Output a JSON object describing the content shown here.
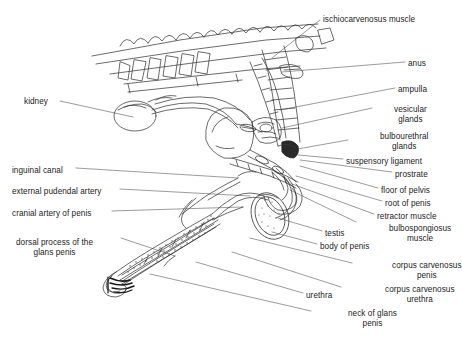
{
  "figure": {
    "background_color": "#ffffff",
    "line_color": "#3a3a3a",
    "text_color": "#1c1c1c",
    "style": "black-and-white line drawing with leader lines"
  },
  "labels_left": [
    {
      "id": "kidney",
      "text": "kidney",
      "x": 24,
      "y": 97,
      "align": "left",
      "lines": [
        "kidney"
      ]
    },
    {
      "id": "inguinal-canal",
      "text": "inguinal canal",
      "x": 12,
      "y": 166,
      "align": "left",
      "lines": [
        "inguinal canal"
      ]
    },
    {
      "id": "external-pudendal-artery",
      "text": "external pudendal artery",
      "x": 12,
      "y": 187,
      "align": "left",
      "lines": [
        "external pudendal artery"
      ]
    },
    {
      "id": "cranial-artery-of-penis",
      "text": "cranial artery of penis",
      "x": 12,
      "y": 209,
      "align": "left",
      "lines": [
        "cranial artery of penis"
      ]
    },
    {
      "id": "dorsal-process-glans",
      "text": "dorsal process of the glans penis",
      "x": 16,
      "y": 238,
      "align": "center",
      "lines": [
        "dorsal process of the",
        "glans penis"
      ]
    }
  ],
  "labels_right": [
    {
      "id": "ischiocarvenosus-muscle",
      "text": "ischiocarvenosus muscle",
      "x": 323,
      "y": 15,
      "align": "left",
      "lines": [
        "ischiocarvenosus muscle"
      ]
    },
    {
      "id": "anus",
      "text": "anus",
      "x": 408,
      "y": 59,
      "align": "left",
      "lines": [
        "anus"
      ]
    },
    {
      "id": "ampulla",
      "text": "ampulla",
      "x": 398,
      "y": 85,
      "align": "left",
      "lines": [
        "ampulla"
      ]
    },
    {
      "id": "vesicular-glands",
      "text": "vesicular glands",
      "x": 394,
      "y": 105,
      "align": "center",
      "lines": [
        "vesicular",
        "glands"
      ]
    },
    {
      "id": "bulbourethral-glands",
      "text": "bulbourethral glands",
      "x": 380,
      "y": 132,
      "align": "center",
      "lines": [
        "bulbourethral",
        "glands"
      ]
    },
    {
      "id": "suspensory-ligament",
      "text": "suspensory ligament",
      "x": 346,
      "y": 157,
      "align": "left",
      "lines": [
        "suspensory ligament"
      ]
    },
    {
      "id": "prostrate",
      "text": "prostrate",
      "x": 395,
      "y": 170,
      "align": "left",
      "lines": [
        "prostrate"
      ]
    },
    {
      "id": "floor-of-pelvis",
      "text": "floor of pelvis",
      "x": 381,
      "y": 186,
      "align": "left",
      "lines": [
        "floor of pelvis"
      ]
    },
    {
      "id": "root-of-penis",
      "text": "root of penis",
      "x": 385,
      "y": 199,
      "align": "left",
      "lines": [
        "root of penis"
      ]
    },
    {
      "id": "retractor-muscle",
      "text": "retractor muscle",
      "x": 377,
      "y": 212,
      "align": "left",
      "lines": [
        "retractor muscle"
      ]
    },
    {
      "id": "bulbospongiosus-muscle",
      "text": "bulbospongiosus muscle",
      "x": 389,
      "y": 224,
      "align": "center",
      "lines": [
        "bulbospongiosus",
        "muscle"
      ]
    },
    {
      "id": "testis",
      "text": "testis",
      "x": 325,
      "y": 229,
      "align": "left",
      "lines": [
        "testis"
      ]
    },
    {
      "id": "body-of-penis",
      "text": "body of penis",
      "x": 320,
      "y": 242,
      "align": "left",
      "lines": [
        "body of penis"
      ]
    },
    {
      "id": "corpus-carvenosus-penis",
      "text": "corpus carvenosus penis",
      "x": 392,
      "y": 261,
      "align": "center",
      "lines": [
        "corpus carvenosus",
        "penis"
      ]
    },
    {
      "id": "corpus-carvenosus-urethra",
      "text": "corpus carvenosus urethra",
      "x": 385,
      "y": 285,
      "align": "center",
      "lines": [
        "corpus carvenosus",
        "urethra"
      ]
    },
    {
      "id": "urethra",
      "text": "urethra",
      "x": 306,
      "y": 291,
      "align": "left",
      "lines": [
        "urethra"
      ]
    },
    {
      "id": "neck-of-glans-penis",
      "text": "neck of glans penis",
      "x": 348,
      "y": 309,
      "align": "center",
      "lines": [
        "neck of glans",
        "penis"
      ]
    }
  ],
  "leader_lines": {
    "count": 22,
    "color": "#555555",
    "width": 0.6
  },
  "anatomy_parts": [
    {
      "id": "sacral-vertebrae",
      "name": "sacral vertebrae"
    },
    {
      "id": "rectum",
      "name": "rectum"
    },
    {
      "id": "kidney-organ",
      "name": "kidney"
    },
    {
      "id": "ureter",
      "name": "ureter"
    },
    {
      "id": "bladder",
      "name": "urinary bladder"
    },
    {
      "id": "vesicular-gland",
      "name": "vesicular gland"
    },
    {
      "id": "ampulla-duct",
      "name": "ampulla of ductus deferens"
    },
    {
      "id": "prostate-gland",
      "name": "prostate"
    },
    {
      "id": "penis-shaft",
      "name": "body of penis"
    },
    {
      "id": "sigmoid-flexure",
      "name": "sigmoid flexure"
    },
    {
      "id": "testis-organ",
      "name": "testis"
    },
    {
      "id": "glans-penis",
      "name": "glans penis"
    }
  ]
}
